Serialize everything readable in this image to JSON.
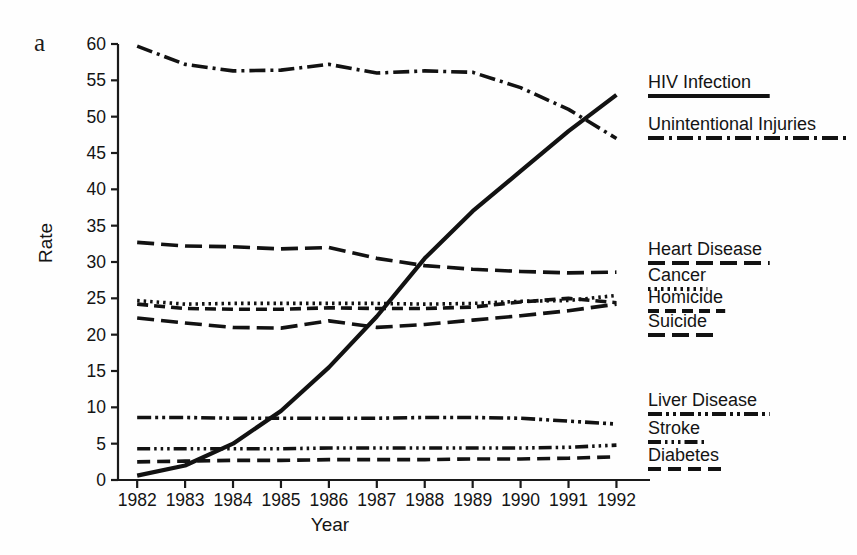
{
  "figure": {
    "panel_label": "a",
    "xlabel": "Year",
    "ylabel": "Rate"
  },
  "chart_data": {
    "type": "line",
    "title": "",
    "xlabel": "Year",
    "ylabel": "Rate",
    "x": [
      1982,
      1983,
      1984,
      1985,
      1986,
      1987,
      1988,
      1989,
      1990,
      1991,
      1992
    ],
    "xlim": [
      1981.6,
      1992.7
    ],
    "ylim": [
      0,
      60
    ],
    "yticks": [
      0,
      5,
      10,
      15,
      20,
      25,
      30,
      35,
      40,
      45,
      50,
      55,
      60
    ],
    "xticks": [
      "1982",
      "1983",
      "1984",
      "1985",
      "1986",
      "1987",
      "1988",
      "1989",
      "1990",
      "1991",
      "1992"
    ],
    "grid": false,
    "legend_position": "right",
    "series": [
      {
        "name": "HIV Infection",
        "style": "solid",
        "values": [
          0.6,
          2.0,
          5.0,
          9.5,
          15.5,
          22.5,
          30.5,
          37.0,
          42.5,
          48.0,
          53.0
        ]
      },
      {
        "name": "Unintentional Injuries",
        "style": "dash-dot",
        "values": [
          59.7,
          57.2,
          56.3,
          56.4,
          57.2,
          56.0,
          56.3,
          56.1,
          54.0,
          51.0,
          47.0
        ]
      },
      {
        "name": "Heart Disease",
        "style": "long-dash",
        "values": [
          32.7,
          32.2,
          32.1,
          31.8,
          32.0,
          30.5,
          29.5,
          29.0,
          28.7,
          28.5,
          28.6
        ]
      },
      {
        "name": "Cancer",
        "style": "dotted",
        "values": [
          24.7,
          24.2,
          24.3,
          24.3,
          24.3,
          24.3,
          24.2,
          24.3,
          24.6,
          24.7,
          25.4
        ]
      },
      {
        "name": "Homicide",
        "style": "medium-dash",
        "values": [
          24.2,
          23.6,
          23.5,
          23.5,
          23.7,
          23.6,
          23.6,
          23.8,
          24.5,
          25.0,
          24.4
        ]
      },
      {
        "name": "Suicide",
        "style": "long-dash",
        "values": [
          22.3,
          21.6,
          21.0,
          20.9,
          21.9,
          21.0,
          21.4,
          22.0,
          22.6,
          23.3,
          24.2
        ]
      },
      {
        "name": "Liver Disease",
        "style": "dash-dot-dot",
        "values": [
          8.6,
          8.6,
          8.5,
          8.5,
          8.5,
          8.5,
          8.6,
          8.6,
          8.5,
          8.1,
          7.7
        ]
      },
      {
        "name": "Stroke",
        "style": "dash-dot-dot-dot",
        "values": [
          4.3,
          4.3,
          4.3,
          4.3,
          4.4,
          4.4,
          4.4,
          4.4,
          4.4,
          4.5,
          4.8
        ]
      },
      {
        "name": "Diabetes",
        "style": "dash",
        "values": [
          2.5,
          2.6,
          2.7,
          2.7,
          2.8,
          2.8,
          2.8,
          2.9,
          2.9,
          3.0,
          3.2
        ]
      }
    ]
  },
  "legend": [
    {
      "label": "HIV Infection",
      "y": 88,
      "style": "solid"
    },
    {
      "label": "Unintentional Injuries",
      "y": 130,
      "style": "dash-dot"
    },
    {
      "label": "Heart Disease",
      "y": 255,
      "style": "long-dash"
    },
    {
      "label": "Cancer",
      "y": 281,
      "style": "dotted"
    },
    {
      "label": "Homicide",
      "y": 303,
      "style": "medium-dash"
    },
    {
      "label": "Suicide",
      "y": 327,
      "style": "long-dash"
    },
    {
      "label": "Liver Disease",
      "y": 406,
      "style": "dash-dot-dot"
    },
    {
      "label": "Stroke",
      "y": 434,
      "style": "dash-dot-dot-dot"
    },
    {
      "label": "Diabetes",
      "y": 461,
      "style": "dash"
    }
  ]
}
